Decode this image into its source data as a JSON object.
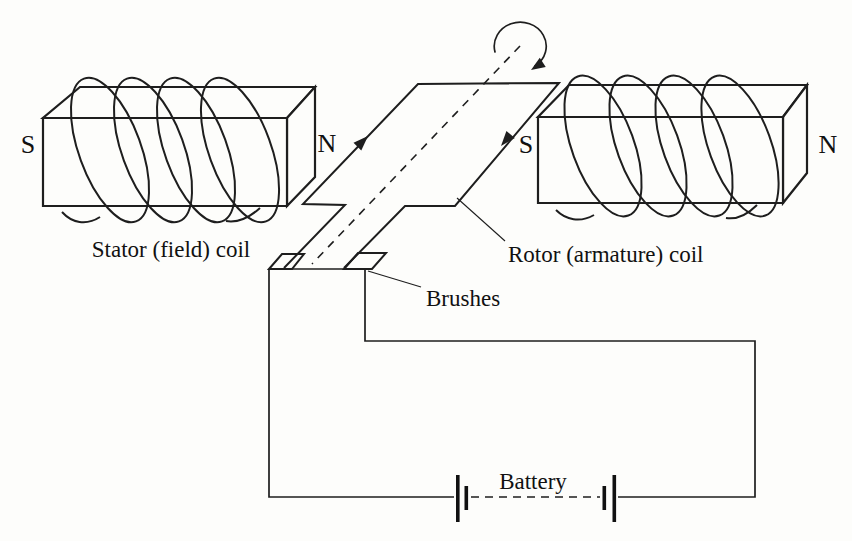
{
  "figure": {
    "type": "dc-motor-schematic",
    "background_color": "#fdfdfb",
    "line_color": "#1e1e1e",
    "labels": {
      "stator_caption": "Stator (field) coil",
      "rotor_caption": "Rotor (armature) coil",
      "brushes": "Brushes",
      "battery": "Battery"
    },
    "poles": {
      "left_magnet_s": "S",
      "left_magnet_n": "N",
      "right_magnet_s": "S",
      "right_magnet_n": "N"
    }
  }
}
